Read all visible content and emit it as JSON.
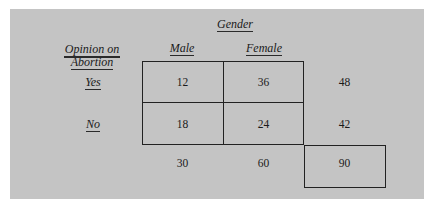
{
  "table": {
    "column_group_label": "Gender",
    "row_group_label_line1": "Opinion on",
    "row_group_label_line2": "Abortion",
    "columns": [
      "Male",
      "Female"
    ],
    "rows": [
      {
        "label": "Yes",
        "values": [
          "12",
          "36"
        ],
        "total": "48"
      },
      {
        "label": "No",
        "values": [
          "18",
          "24"
        ],
        "total": "42"
      }
    ],
    "column_totals": [
      "30",
      "60"
    ],
    "grand_total": "90"
  }
}
